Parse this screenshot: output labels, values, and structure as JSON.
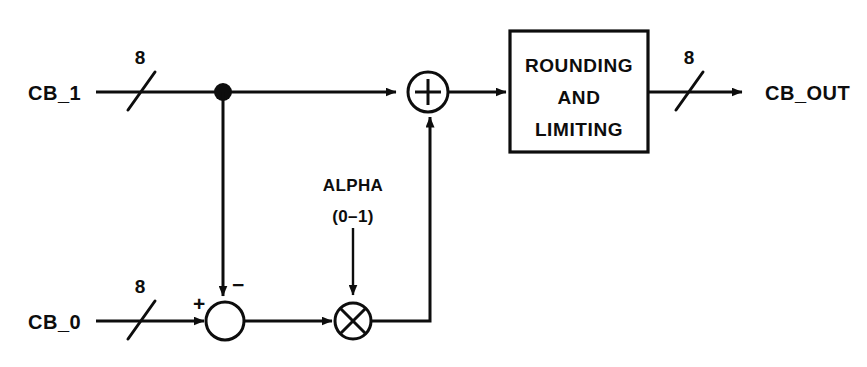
{
  "diagram": {
    "background_color": "#ffffff",
    "line_color": "#0d0d0d",
    "inputs": [
      {
        "name": "cb1",
        "label": "CB_1",
        "bus_width": "8"
      },
      {
        "name": "cb0",
        "label": "CB_0",
        "bus_width": "8"
      }
    ],
    "outputs": [
      {
        "name": "cbout",
        "label": "CB_OUT",
        "bus_width": "8"
      }
    ],
    "parameter": {
      "label": "ALPHA",
      "range": "(0–1)"
    },
    "summing_junction": {
      "name": "subtractor",
      "operator": "subtract",
      "positive_sign": "+",
      "negative_sign": "−"
    },
    "multiplier": {
      "name": "multiplier",
      "operator": "multiply"
    },
    "adder": {
      "name": "adder",
      "operator": "+"
    },
    "process_block": {
      "name": "rounding-and-limiting",
      "lines": [
        "ROUNDING",
        "AND",
        "LIMITING"
      ]
    }
  }
}
